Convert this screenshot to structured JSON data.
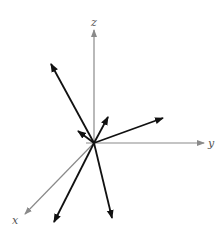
{
  "diagram": {
    "title": "",
    "axes": {
      "x": {
        "label": "x",
        "color": "#8a8a8a"
      },
      "y": {
        "label": "y",
        "color": "#8a8a8a"
      },
      "z": {
        "label": "z",
        "color": "#8a8a8a"
      }
    },
    "vector_color": "#111111",
    "vector_count": 6
  }
}
